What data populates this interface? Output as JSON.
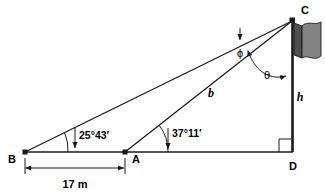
{
  "figure": {
    "type": "geometry-diagram",
    "background_color": "#ffffff",
    "line_color": "#1a1a1a",
    "flag_color": "#808080",
    "flag_shade_color": "#5a5a5a"
  },
  "points": {
    "b": {
      "label": "B",
      "x": 25,
      "y": 152
    },
    "a": {
      "label": "A",
      "x": 125,
      "y": 152
    },
    "d": {
      "label": "D",
      "x": 293,
      "y": 152
    },
    "c": {
      "label": "C",
      "x": 293,
      "y": 20
    }
  },
  "angles": {
    "at_b": {
      "label": "25°43′",
      "vertex": "B",
      "value_deg": 25,
      "value_min": 43
    },
    "at_a": {
      "label": "37°11′",
      "vertex": "A",
      "value_deg": 37,
      "value_min": 11
    },
    "phi": {
      "label": "ϕ",
      "name": "phi",
      "vertex": "C",
      "between": "BC and AC"
    },
    "theta": {
      "label": "θ",
      "name": "theta",
      "vertex": "C",
      "between": "AC and CD"
    },
    "right_angle": {
      "label": "",
      "vertex": "D",
      "value_deg": 90
    }
  },
  "segments": {
    "b_side": {
      "label": "b",
      "from": "A",
      "to": "C"
    },
    "height": {
      "label": "h",
      "from": "D",
      "to": "C"
    },
    "baseline_dim": {
      "label": "17 m",
      "from": "B",
      "to": "A",
      "value": 17,
      "unit": "m"
    }
  },
  "flag": {
    "name": "flag-on-pole",
    "attached_to": "C",
    "color": "#808080"
  }
}
